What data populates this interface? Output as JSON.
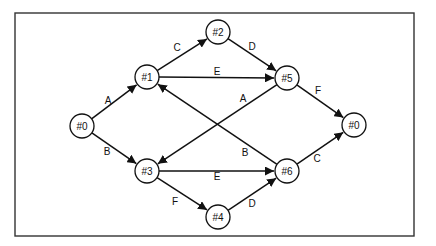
{
  "diagram": {
    "type": "directed-graph",
    "nodes": [
      {
        "id": "n0a",
        "label": "#0",
        "x": 82,
        "y": 126
      },
      {
        "id": "n1",
        "label": "#1",
        "x": 147,
        "y": 77
      },
      {
        "id": "n2",
        "label": "#2",
        "x": 218,
        "y": 32
      },
      {
        "id": "n5",
        "label": "#5",
        "x": 287,
        "y": 78
      },
      {
        "id": "n0b",
        "label": "#0",
        "x": 354,
        "y": 125
      },
      {
        "id": "n3",
        "label": "#3",
        "x": 147,
        "y": 171
      },
      {
        "id": "n4",
        "label": "#4",
        "x": 218,
        "y": 217
      },
      {
        "id": "n6",
        "label": "#6",
        "x": 287,
        "y": 171
      }
    ],
    "edges": [
      {
        "from": "n0a",
        "to": "n1",
        "label": "A",
        "lx": 108,
        "ly": 100
      },
      {
        "from": "n0a",
        "to": "n3",
        "label": "B",
        "lx": 107,
        "ly": 151
      },
      {
        "from": "n1",
        "to": "n2",
        "label": "C",
        "lx": 177,
        "ly": 47
      },
      {
        "from": "n2",
        "to": "n5",
        "label": "D",
        "lx": 252,
        "ly": 46
      },
      {
        "from": "n1",
        "to": "n5",
        "label": "E",
        "lx": 217,
        "ly": 71
      },
      {
        "from": "n5",
        "to": "n3",
        "label": "A",
        "lx": 243,
        "ly": 98
      },
      {
        "from": "n5",
        "to": "n0b",
        "label": "F",
        "lx": 318,
        "ly": 90
      },
      {
        "from": "n6",
        "to": "n1",
        "label": "B",
        "lx": 245,
        "ly": 152
      },
      {
        "from": "n3",
        "to": "n6",
        "label": "E",
        "lx": 217,
        "ly": 176
      },
      {
        "from": "n3",
        "to": "n4",
        "label": "F",
        "lx": 175,
        "ly": 201
      },
      {
        "from": "n4",
        "to": "n6",
        "label": "D",
        "lx": 252,
        "ly": 203
      },
      {
        "from": "n6",
        "to": "n0b",
        "label": "C",
        "lx": 317,
        "ly": 158
      }
    ],
    "frame": {
      "x": 15,
      "y": 13,
      "width": 399,
      "height": 223
    },
    "node_radius": 12,
    "colors": {
      "stroke": "#111111",
      "background": "#ffffff"
    }
  }
}
